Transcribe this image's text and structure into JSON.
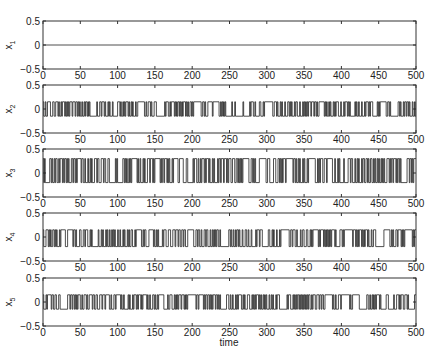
{
  "chart_data": {
    "type": "line",
    "layout": "5 vertically stacked subplots sharing x-axis",
    "xlabel": "time",
    "xlim": [
      0,
      500
    ],
    "xticks": [
      0,
      50,
      100,
      150,
      200,
      250,
      300,
      350,
      400,
      450,
      500
    ],
    "grid": false,
    "legend": null,
    "subplots": [
      {
        "name": "x1",
        "ylabel": "x",
        "ylabel_sub": "1",
        "ylim": [
          -0.5,
          0.5
        ],
        "yticks": [
          -0.5,
          0,
          0.5
        ],
        "description": "constant zero signal",
        "levels": [
          0,
          0
        ],
        "switch_prob": 0,
        "seed": 1
      },
      {
        "name": "x2",
        "ylabel": "x",
        "ylabel_sub": "2",
        "ylim": [
          -0.5,
          0.5
        ],
        "yticks": [
          -0.5,
          0,
          0.5
        ],
        "description": "binary switching signal between approx +0.15 and -0.15",
        "levels": [
          0.15,
          -0.15
        ],
        "switch_prob": 0.42,
        "seed": 7
      },
      {
        "name": "x3",
        "ylabel": "x",
        "ylabel_sub": "3",
        "ylim": [
          -0.5,
          0.5
        ],
        "yticks": [
          -0.5,
          0,
          0.5
        ],
        "description": "binary switching signal between approx +0.3 and -0.2",
        "levels": [
          0.3,
          -0.2
        ],
        "switch_prob": 0.4,
        "seed": 13
      },
      {
        "name": "x4",
        "ylabel": "x",
        "ylabel_sub": "4",
        "ylim": [
          -0.5,
          0.5
        ],
        "yticks": [
          -0.5,
          0,
          0.5
        ],
        "description": "binary switching signal between approx +0.15 and -0.2",
        "levels": [
          0.15,
          -0.2
        ],
        "switch_prob": 0.42,
        "seed": 29
      },
      {
        "name": "x5",
        "ylabel": "x",
        "ylabel_sub": "5",
        "ylim": [
          -0.5,
          0.5
        ],
        "yticks": [
          -0.5,
          0,
          0.5
        ],
        "description": "binary switching signal between approx +0.15 and -0.15",
        "levels": [
          0.15,
          -0.15
        ],
        "switch_prob": 0.38,
        "seed": 41
      }
    ]
  },
  "labels": {
    "xlabel": "time"
  }
}
